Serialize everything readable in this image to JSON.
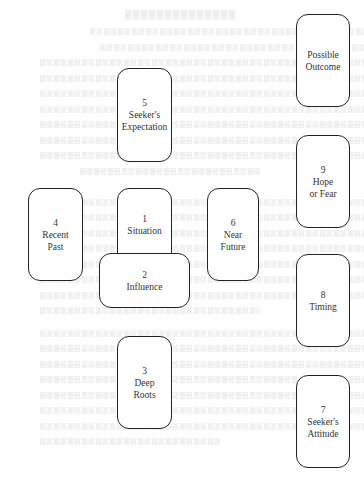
{
  "diagram": {
    "type": "tarot-card-layout",
    "cards": [
      {
        "id": "c1",
        "number": "1",
        "label_lines": [
          "Situation"
        ],
        "x": 117,
        "y": 188,
        "w": 55,
        "h": 93
      },
      {
        "id": "c2",
        "number": "2",
        "label_lines": [
          "Influence"
        ],
        "x": 99,
        "y": 253,
        "w": 91,
        "h": 55,
        "orientation": "horizontal",
        "crosses": "c1"
      },
      {
        "id": "c3",
        "number": "3",
        "label_lines": [
          "Deep",
          "Roots"
        ],
        "x": 117,
        "y": 336,
        "w": 55,
        "h": 93
      },
      {
        "id": "c4",
        "number": "4",
        "label_lines": [
          "Recent",
          "Past"
        ],
        "x": 28,
        "y": 188,
        "w": 55,
        "h": 93
      },
      {
        "id": "c5",
        "number": "5",
        "label_lines": [
          "Seeker's",
          "Expectation"
        ],
        "x": 117,
        "y": 68,
        "w": 55,
        "h": 94
      },
      {
        "id": "c6",
        "number": "6",
        "label_lines": [
          "Near",
          "Future"
        ],
        "x": 207,
        "y": 188,
        "w": 52,
        "h": 93
      },
      {
        "id": "c7",
        "number": "7",
        "label_lines": [
          "Seeker's",
          "Attitude"
        ],
        "x": 296,
        "y": 375,
        "w": 54,
        "h": 93
      },
      {
        "id": "c8",
        "number": "8",
        "label_lines": [
          "Timing"
        ],
        "x": 296,
        "y": 254,
        "w": 54,
        "h": 93
      },
      {
        "id": "c9",
        "number": "9",
        "label_lines": [
          "Hope",
          "or Fear"
        ],
        "x": 296,
        "y": 135,
        "w": 54,
        "h": 93
      },
      {
        "id": "c10",
        "number": "",
        "label_lines": [
          "Possible",
          "Outcome"
        ],
        "x": 296,
        "y": 14,
        "w": 54,
        "h": 93
      }
    ]
  },
  "labels": {
    "c1": {
      "num": "1",
      "l1": "Situation"
    },
    "c2": {
      "num": "2",
      "l1": "Influence"
    },
    "c3": {
      "num": "3",
      "l1": "Deep",
      "l2": "Roots"
    },
    "c4": {
      "num": "4",
      "l1": "Recent",
      "l2": "Past"
    },
    "c5": {
      "num": "5",
      "l1": "Seeker's",
      "l2": "Expectation"
    },
    "c6": {
      "num": "6",
      "l1": "Near",
      "l2": "Future"
    },
    "c7": {
      "num": "7",
      "l1": "Seeker's",
      "l2": "Attitude"
    },
    "c8": {
      "num": "8",
      "l1": "Timing"
    },
    "c9": {
      "num": "9",
      "l1": "Hope",
      "l2": "or Fear"
    },
    "c10": {
      "l1": "Possible",
      "l2": "Outcome"
    }
  },
  "colors": {
    "card_border": "#222222",
    "card_text": "#333333",
    "background": "#ffffff",
    "bleed_through": "#ececec"
  }
}
